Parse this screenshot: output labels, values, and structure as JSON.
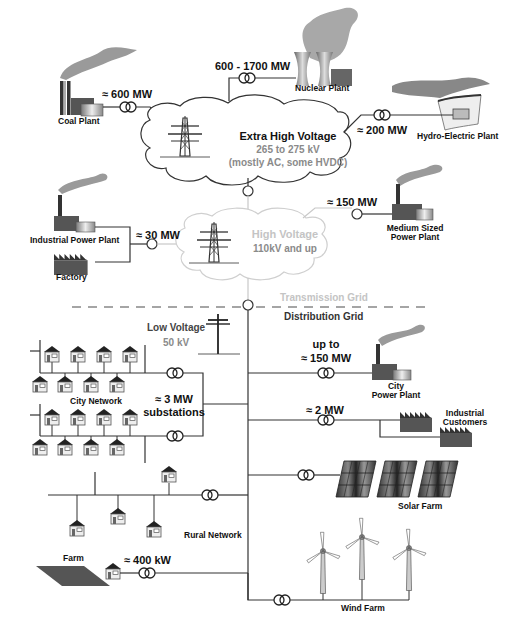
{
  "diagram": {
    "grids": {
      "transmission_label": "Transmission Grid",
      "distribution_label": "Distribution Grid"
    },
    "clouds": {
      "extra_high_voltage": {
        "title": "Extra High Voltage",
        "range": "265 to 275 kV",
        "note": "(mostly AC, some HVDC)"
      },
      "high_voltage": {
        "title": "High Voltage",
        "range": "110kV and up"
      },
      "low_voltage": {
        "title": "Low Voltage",
        "range": "50 kV"
      }
    },
    "generators": {
      "coal": {
        "label": "Coal Plant",
        "power": "≈ 600  MW"
      },
      "nuclear": {
        "label": "Nuclear Plant",
        "power": "600 - 1700  MW"
      },
      "hydro": {
        "label": "Hydro-Electric Plant",
        "power": "≈ 200  MW"
      },
      "industrial_plant": {
        "label": "Industrial Power Plant",
        "power": "≈ 30 MW"
      },
      "factory": {
        "label": "Factory"
      },
      "medium_plant": {
        "label_line1": "Medium Sized",
        "label_line2": "Power Plant",
        "power": "≈ 150  MW"
      },
      "city_plant": {
        "label_line1": "City",
        "label_line2": "Power Plant",
        "power_line1": "up to",
        "power_line2": "≈ 150  MW"
      },
      "industrial_customers": {
        "label_line1": "Industrial",
        "label_line2": "Customers",
        "power": "≈ 2  MW"
      },
      "solar": {
        "label": "Solar Farm"
      },
      "wind": {
        "label": "Wind Farm"
      }
    },
    "networks": {
      "city": {
        "label": "City Network",
        "power_line1": "≈ 3  MW",
        "power_line2": "substations"
      },
      "rural": {
        "label": "Rural Network"
      },
      "farm": {
        "label": "Farm",
        "power": "≈ 400 kW"
      }
    },
    "colors": {
      "line": "#333333",
      "light_line": "#c8c8c8",
      "smoke": "#9a9a9a",
      "building_dark": "#444444",
      "building_mid": "#666666"
    }
  }
}
